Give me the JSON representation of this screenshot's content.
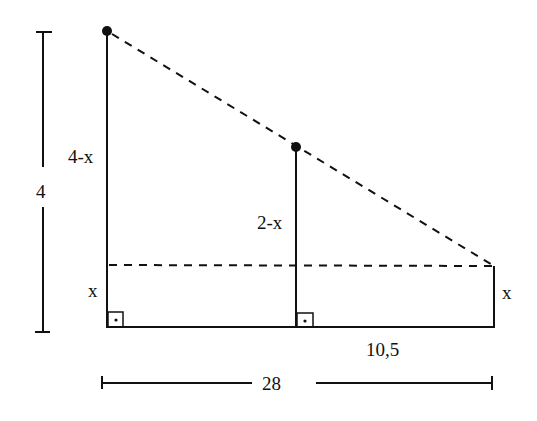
{
  "diagram": {
    "type": "geometry-similar-triangles",
    "labels": {
      "total_height": "4",
      "left_upper": "4-x",
      "left_lower": "x",
      "middle_upper": "2-x",
      "right_side": "x",
      "bottom_right_segment": "10,5",
      "total_width": "28"
    },
    "right_angle_markers": 2,
    "points": {
      "top_left_dot": {
        "x": 107,
        "y": 31
      },
      "middle_dot": {
        "x": 296,
        "y": 147
      },
      "right_corner": {
        "x": 494,
        "y": 266
      }
    },
    "colors": {
      "stroke": "#111111",
      "background": "#ffffff"
    }
  }
}
